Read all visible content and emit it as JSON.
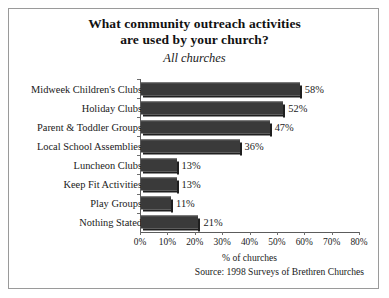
{
  "chart_data": {
    "type": "bar",
    "orientation": "horizontal",
    "title": "What community outreach activities are used by your church?",
    "title_lines": [
      "What community outreach activities",
      "are used by your church?"
    ],
    "subtitle": "All churches",
    "xlabel": "% of churches",
    "ylabel": "",
    "xlim": [
      0,
      80
    ],
    "grid": false,
    "legend": null,
    "bar_color": "#3a3a3a",
    "categories": [
      "Midweek Children's Clubs",
      "Holiday Clubs",
      "Parent & Toddler Groups",
      "Local School Assemblies",
      "Luncheon Clubs",
      "Keep Fit Activities",
      "Play Groups",
      "Nothing Stated"
    ],
    "values": [
      58,
      52,
      47,
      36,
      13,
      13,
      11,
      21
    ],
    "value_labels": [
      "58%",
      "52%",
      "47%",
      "36%",
      "13%",
      "13%",
      "11%",
      "21%"
    ],
    "xticks": [
      0,
      10,
      20,
      30,
      40,
      50,
      60,
      70,
      80
    ],
    "xtick_labels": [
      "0%",
      "10%",
      "20%",
      "30%",
      "40%",
      "50%",
      "60%",
      "70%",
      "80%"
    ]
  },
  "source": "Source: 1998 Surveys of Brethren Churches"
}
